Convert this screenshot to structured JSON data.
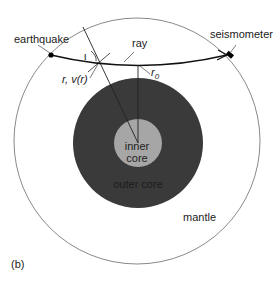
{
  "diagram": {
    "panel_label": "(b)",
    "labels": {
      "earthquake": "earthquake",
      "seismometer": "seismometer",
      "ray": "ray",
      "incidence_angle": "ι",
      "radius_velocity": "r, v(r)",
      "turning_radius": "r",
      "turning_radius_sub": "0",
      "inner_core_line1": "inner",
      "inner_core_line2": "core",
      "outer_core": "outer core",
      "mantle": "mantle"
    },
    "colors": {
      "mantle": "#ffffff",
      "outer_core": "#3a3a3a",
      "inner_core": "#a6a6a6",
      "outline": "#888888",
      "ray": "#111111"
    }
  }
}
